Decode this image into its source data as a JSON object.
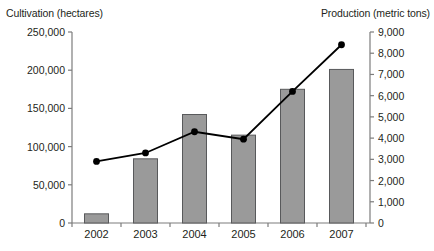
{
  "chart_data": {
    "type": "bar",
    "title": "",
    "categories": [
      "2002",
      "2003",
      "2004",
      "2005",
      "2006",
      "2007"
    ],
    "xlabel": "",
    "grid": false,
    "legend_position": "none",
    "series": [
      {
        "name": "Cultivation (hectares)",
        "type": "bar",
        "axis": "left",
        "color": "#9a9a9a",
        "edge_color": "#58595b",
        "values": [
          12000,
          84000,
          142000,
          115000,
          175000,
          201000
        ]
      },
      {
        "name": "Production (metric tons)",
        "type": "line",
        "axis": "right",
        "color": "#000000",
        "marker": "circle",
        "values": [
          2900,
          3300,
          4300,
          3950,
          6200,
          8400
        ]
      }
    ],
    "left_axis": {
      "label": "Cultivation (hectares)",
      "ylim": [
        0,
        250000
      ],
      "ticks": [
        0,
        50000,
        100000,
        150000,
        200000,
        250000
      ],
      "tick_labels": [
        "0",
        "50,000",
        "100,000",
        "150,000",
        "200,000",
        "250,000"
      ]
    },
    "right_axis": {
      "label": "Production (metric tons)",
      "ylim": [
        0,
        9000
      ],
      "ticks": [
        0,
        1000,
        2000,
        3000,
        4000,
        5000,
        6000,
        7000,
        8000,
        9000
      ],
      "tick_labels": [
        "0",
        "1,000",
        "2,000",
        "3,000",
        "4,000",
        "5,000",
        "6,000",
        "7,000",
        "8,000",
        "9,000"
      ]
    }
  },
  "labels": {
    "left_axis_title": "Cultivation (hectares)",
    "right_axis_title": "Production (metric tons)"
  },
  "colors": {
    "bar_fill": "#9a9a9a",
    "bar_edge": "#58595b",
    "line": "#000000",
    "axis": "#7c7c7c",
    "text": "#231f20",
    "background": "#ffffff"
  }
}
